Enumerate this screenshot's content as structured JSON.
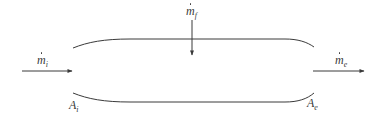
{
  "diagram": {
    "type": "control-volume-duct",
    "stroke_color": "#3a3a3a",
    "labels": {
      "inlet_mass_flow": {
        "symbol": "m",
        "dot": true,
        "subscript": "i"
      },
      "fuel_mass_flow": {
        "symbol": "m",
        "dot": true,
        "subscript": "f"
      },
      "exit_mass_flow": {
        "symbol": "m",
        "dot": true,
        "subscript": "e"
      },
      "inlet_area": {
        "symbol": "A",
        "subscript": "i"
      },
      "exit_area": {
        "symbol": "A",
        "subscript": "e"
      }
    },
    "arrows": [
      {
        "id": "inlet",
        "from": [
          22,
          71
        ],
        "to": [
          72,
          71
        ],
        "direction": "right"
      },
      {
        "id": "fuel",
        "from": [
          192,
          20
        ],
        "to": [
          192,
          55
        ],
        "direction": "down"
      },
      {
        "id": "exit",
        "from": [
          313,
          71
        ],
        "to": [
          364,
          71
        ],
        "direction": "right"
      }
    ],
    "walls": {
      "top": "M73,48 C88,42 104,39 130,39 L285,39 C298,39 307,42 314,47",
      "bottom": "M73,93 C88,99 104,102 130,102 L285,102 C298,102 307,99 314,93"
    }
  }
}
